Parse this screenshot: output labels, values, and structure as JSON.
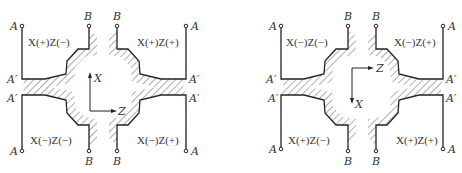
{
  "figure": {
    "diagrams": [
      {
        "id": "left",
        "axes": {
          "vertical_label": "X",
          "vertical_direction": "up",
          "horizontal_label": "Z",
          "horizontal_direction": "right"
        },
        "point_labels": {
          "top_left_end": "A",
          "top_left_corner": "A′",
          "top_left_b": "B",
          "top_right_b": "B",
          "top_right_end": "A",
          "top_right_corner": "A′",
          "bottom_left_corner": "A′",
          "bottom_left_end": "A",
          "bottom_left_b": "B",
          "bottom_right_b": "B",
          "bottom_right_corner": "A′",
          "bottom_right_end": "A"
        },
        "quadrants": {
          "top_left": "X(+)Z(−)",
          "top_right": "X(+)Z(+)",
          "bottom_left": "X(−)Z(−)",
          "bottom_right": "X(−)Z(+)"
        }
      },
      {
        "id": "right",
        "axes": {
          "vertical_label": "X",
          "vertical_direction": "down",
          "horizontal_label": "Z",
          "horizontal_direction": "right"
        },
        "point_labels": {
          "top_left_end": "A",
          "top_left_corner": "A′",
          "top_left_b": "B",
          "top_right_b": "B",
          "top_right_end": "A",
          "top_right_corner": "A′",
          "bottom_left_corner": "A′",
          "bottom_left_end": "A",
          "bottom_left_b": "B",
          "bottom_right_b": "B",
          "bottom_right_corner": "A′",
          "bottom_right_end": "A"
        },
        "quadrants": {
          "top_left": "X(−)Z(−)",
          "top_right": "X(−)Z(+)",
          "bottom_left": "X(+)Z(−)",
          "bottom_right": "X(+)Z(+)"
        }
      }
    ]
  }
}
